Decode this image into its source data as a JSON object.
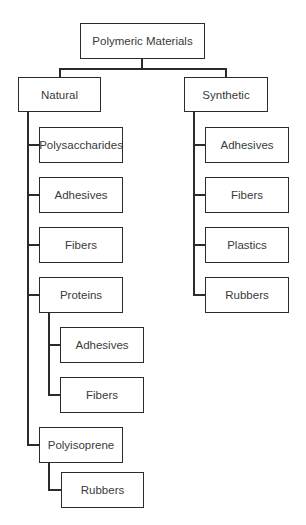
{
  "diagram": {
    "type": "tree",
    "root": {
      "label": "Polymeric Materials",
      "children": [
        {
          "label": "Natural",
          "children": [
            {
              "label": "Polysaccharides"
            },
            {
              "label": "Adhesives"
            },
            {
              "label": "Fibers"
            },
            {
              "label": "Proteins",
              "children": [
                {
                  "label": "Adhesives"
                },
                {
                  "label": "Fibers"
                }
              ]
            },
            {
              "label": "Polyisoprene",
              "children": [
                {
                  "label": "Rubbers"
                }
              ]
            }
          ]
        },
        {
          "label": "Synthetic",
          "children": [
            {
              "label": "Adhesives"
            },
            {
              "label": "Fibers"
            },
            {
              "label": "Plastics"
            },
            {
              "label": "Rubbers"
            }
          ]
        }
      ]
    }
  },
  "colors": {
    "line": "#2b2b2b",
    "text": "#3a3a3a",
    "background": "#ffffff"
  }
}
